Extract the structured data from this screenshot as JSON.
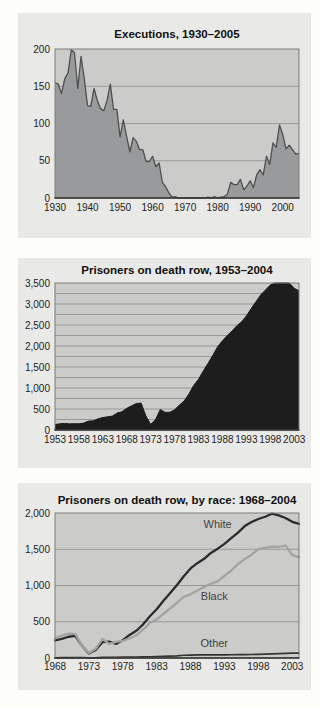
{
  "theme": {
    "page_bg": "#fdfdfb",
    "panel_bg": "#e9e9e7",
    "plot_bg": "#cbccca",
    "grid_color": "#8c8d8b",
    "border_color": "#7c7d7b",
    "axis_color": "#2f2f2d",
    "tick_color": "#232321",
    "title_color": "#101010",
    "series_label_color": "#3f3f3d"
  },
  "chart_data": [
    {
      "type": "area",
      "title": "Executions, 1930–2005",
      "x_start": 1930,
      "xlim": [
        1930,
        2005
      ],
      "xticks": [
        1930,
        1940,
        1950,
        1960,
        1970,
        1980,
        1990,
        2000
      ],
      "ylim": [
        0,
        200
      ],
      "ytick_step": 50,
      "grid_step": 50,
      "comma": false,
      "fill": "#999a9b",
      "stroke": "#4e4f50",
      "stroke_width": 1.3,
      "values": [
        155,
        153,
        140,
        160,
        168,
        199,
        195,
        147,
        190,
        160,
        124,
        123,
        147,
        131,
        120,
        117,
        131,
        153,
        119,
        119,
        82,
        105,
        83,
        62,
        81,
        76,
        65,
        65,
        49,
        49,
        56,
        42,
        47,
        21,
        15,
        7,
        1,
        2,
        0,
        0,
        0,
        0,
        0,
        0,
        0,
        0,
        0,
        1,
        0,
        2,
        0,
        1,
        2,
        5,
        21,
        18,
        18,
        25,
        11,
        16,
        23,
        14,
        31,
        38,
        31,
        56,
        45,
        74,
        68,
        98,
        85,
        66,
        71,
        65,
        59,
        60
      ]
    },
    {
      "type": "area",
      "title": "Prisoners on death row, 1953–2004",
      "x_start": 1953,
      "xlim": [
        1953,
        2004
      ],
      "xticks": [
        1953,
        1958,
        1963,
        1968,
        1973,
        1978,
        1983,
        1988,
        1993,
        1998,
        2003
      ],
      "ylim": [
        0,
        3500
      ],
      "ytick_step": 500,
      "grid_step": 250,
      "comma": true,
      "fill": "#1d1d1d",
      "stroke": "#1d1d1d",
      "stroke_width": 1,
      "values": [
        131,
        147,
        157,
        146,
        151,
        147,
        164,
        212,
        219,
        267,
        297,
        315,
        331,
        406,
        435,
        517,
        575,
        631,
        642,
        334,
        134,
        244,
        488,
        420,
        423,
        482,
        593,
        692,
        860,
        1066,
        1209,
        1405,
        1591,
        1781,
        1984,
        2124,
        2250,
        2356,
        2482,
        2575,
        2716,
        2890,
        3054,
        3219,
        3335,
        3452,
        3527,
        3593,
        3581,
        3557,
        3374,
        3315
      ]
    },
    {
      "type": "line",
      "title": "Prisoners on death row, by race: 1968–2004",
      "x_start": 1968,
      "xlim": [
        1968,
        2004
      ],
      "xticks": [
        1968,
        1973,
        1978,
        1983,
        1988,
        1993,
        1998,
        2003
      ],
      "ylim": [
        0,
        2000
      ],
      "ytick_step": 500,
      "grid_step": 500,
      "comma": true,
      "series": [
        {
          "name": "White",
          "color": "#2b2b2b",
          "width": 2.3,
          "label": {
            "x": 1992,
            "y": 1790
          },
          "values": [
            243,
            263,
            293,
            306,
            167,
            62,
            110,
            218,
            225,
            195,
            245,
            318,
            376,
            464,
            576,
            672,
            790,
            896,
            1006,
            1128,
            1235,
            1308,
            1368,
            1449,
            1508,
            1575,
            1653,
            1730,
            1820,
            1876,
            1917,
            1948,
            1990,
            1968,
            1931,
            1878,
            1850
          ]
        },
        {
          "name": "Black",
          "color": "#a3a3a1",
          "width": 2.3,
          "label": {
            "x": 1991.5,
            "y": 800
          },
          "values": [
            271,
            310,
            335,
            332,
            166,
            70,
            128,
            262,
            195,
            222,
            237,
            270,
            313,
            393,
            484,
            532,
            608,
            684,
            762,
            845,
            878,
            931,
            979,
            1025,
            1058,
            1133,
            1207,
            1294,
            1365,
            1425,
            1502,
            1520,
            1535,
            1531,
            1553,
            1418,
            1390
          ]
        },
        {
          "name": "Other",
          "color": "#333331",
          "width": 1.7,
          "label": {
            "x": 1991.5,
            "y": 150
          },
          "values": [
            3,
            4,
            5,
            6,
            4,
            2,
            3,
            8,
            9,
            10,
            11,
            12,
            14,
            15,
            17,
            19,
            22,
            26,
            30,
            38,
            41,
            42,
            43,
            43,
            44,
            44,
            45,
            46,
            47,
            48,
            51,
            54,
            58,
            61,
            64,
            66,
            68
          ]
        }
      ]
    }
  ]
}
